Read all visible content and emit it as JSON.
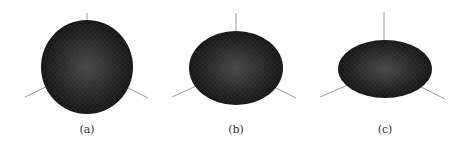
{
  "figure": {
    "panels": [
      {
        "label": "(a)",
        "shape": "sphere",
        "cx": 87,
        "cy": 67,
        "rx": 46,
        "ry": 47
      },
      {
        "label": "(b)",
        "shape": "oblate-spheroid",
        "cx": 236,
        "cy": 68,
        "rx": 47,
        "ry": 37
      },
      {
        "label": "(c)",
        "shape": "flattened-ellipsoid",
        "cx": 385,
        "cy": 69,
        "rx": 47,
        "ry": 29
      }
    ],
    "colors": {
      "surface": "#1a1a1a",
      "highlight": "#4a4a4a",
      "axis": "#9a9a9a"
    }
  }
}
